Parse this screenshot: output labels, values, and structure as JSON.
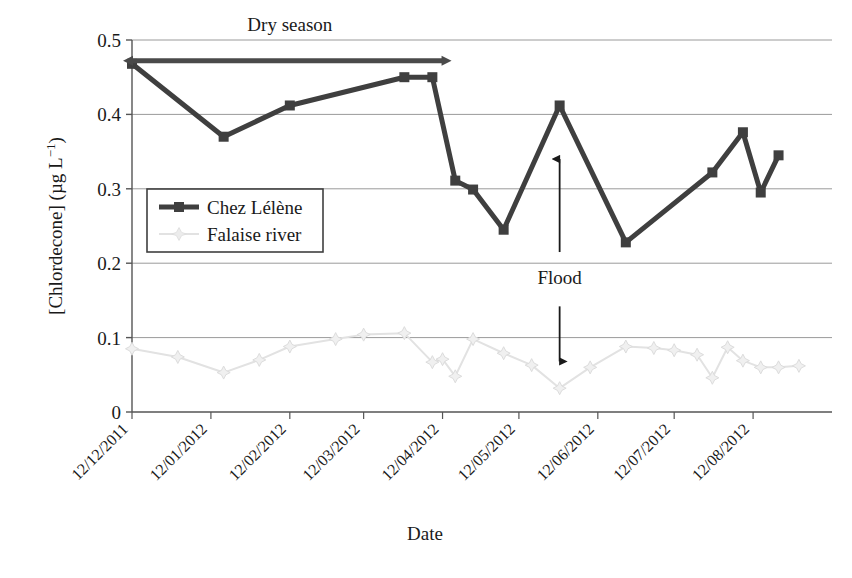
{
  "chart_data": {
    "type": "line",
    "title": "",
    "xlabel": "Date",
    "ylabel": "[Chlordecone] (µg L−1)",
    "ylabel_main": "[Chlordecone] (µg L",
    "ylabel_exponent": "−1",
    "ylabel_tail": ")",
    "ylim": [
      0,
      0.5
    ],
    "yticks": [
      "0",
      "0.1",
      "0.2",
      "0.3",
      "0.4",
      "0.5"
    ],
    "ytick_values": [
      0,
      0.1,
      0.2,
      0.3,
      0.4,
      0.5
    ],
    "grid": true,
    "grid_axis": "y",
    "legend_position": "upper-left-inside",
    "xticks": [
      "12/12/2011",
      "12/01/2012",
      "12/02/2012",
      "12/03/2012",
      "12/04/2012",
      "12/05/2012",
      "12/06/2012",
      "12/07/2012",
      "12/08/2012"
    ],
    "xtick_positions_days": [
      0,
      31,
      62,
      91,
      122,
      152,
      183,
      213,
      244
    ],
    "xlim_days": [
      0,
      275
    ],
    "series": [
      {
        "name": "Chez Lélène",
        "color": "#3f3f3f",
        "marker": "square",
        "linewidth": 5,
        "x_days": [
          0,
          36,
          62,
          107,
          118,
          127,
          134,
          146,
          168,
          194,
          228,
          240,
          247,
          254
        ],
        "values": [
          0.468,
          0.37,
          0.412,
          0.45,
          0.45,
          0.311,
          0.299,
          0.245,
          0.412,
          0.228,
          0.322,
          0.376,
          0.295,
          0.345
        ]
      },
      {
        "name": "Falaise river",
        "color": "#e2e2e2",
        "marker": "diamond-star",
        "linewidth": 2,
        "x_days": [
          0,
          18,
          36,
          50,
          62,
          80,
          91,
          107,
          118,
          122,
          127,
          134,
          146,
          157,
          168,
          180,
          194,
          205,
          213,
          222,
          228,
          234,
          240,
          247,
          254,
          262
        ],
        "values": [
          0.085,
          0.074,
          0.053,
          0.07,
          0.088,
          0.098,
          0.104,
          0.106,
          0.067,
          0.071,
          0.048,
          0.098,
          0.079,
          0.063,
          0.032,
          0.06,
          0.088,
          0.086,
          0.083,
          0.077,
          0.046,
          0.087,
          0.069,
          0.06,
          0.06,
          0.062
        ]
      }
    ],
    "annotations": [
      {
        "name": "dry-season",
        "label": "Dry season",
        "type": "double-arrow",
        "x_start_days": 0,
        "x_end_days": 122,
        "y_value": 0.472,
        "label_x_days": 62,
        "label_y_value": 0.512
      },
      {
        "name": "flood",
        "label": "Flood",
        "type": "double-ended-vertical",
        "x_days": 168,
        "y_top": 0.34,
        "y_bottom": 0.068,
        "label_y_value": 0.172
      }
    ]
  },
  "legend": {
    "entries": [
      {
        "label": "Chez Lélène"
      },
      {
        "label": "Falaise river"
      }
    ]
  }
}
